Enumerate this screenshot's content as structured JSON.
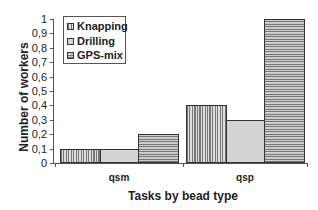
{
  "chart_data": {
    "type": "bar",
    "title": "",
    "xlabel": "Tasks by bead type",
    "ylabel": "Number of workers",
    "categories": [
      "qsm",
      "qsp"
    ],
    "series": [
      {
        "name": "Knapping",
        "values": [
          0.1,
          0.4
        ],
        "pattern": "vertical-lines"
      },
      {
        "name": "Drilling",
        "values": [
          0.1,
          0.3
        ],
        "pattern": "dots"
      },
      {
        "name": "GPS-mix",
        "values": [
          0.2,
          1.0
        ],
        "pattern": "horizontal-lines"
      }
    ],
    "ylim": [
      0,
      1
    ],
    "yticks": [
      "0",
      "0,1",
      "0,2",
      "0,3",
      "0,4",
      "0,5",
      "0,6",
      "0,7",
      "0,8",
      "0,9",
      "1"
    ],
    "grid": false,
    "legend_position": "top-left inside"
  },
  "legend": {
    "items": [
      {
        "label": "Knapping"
      },
      {
        "label": "Drilling"
      },
      {
        "label": "GPS-mix"
      }
    ]
  }
}
